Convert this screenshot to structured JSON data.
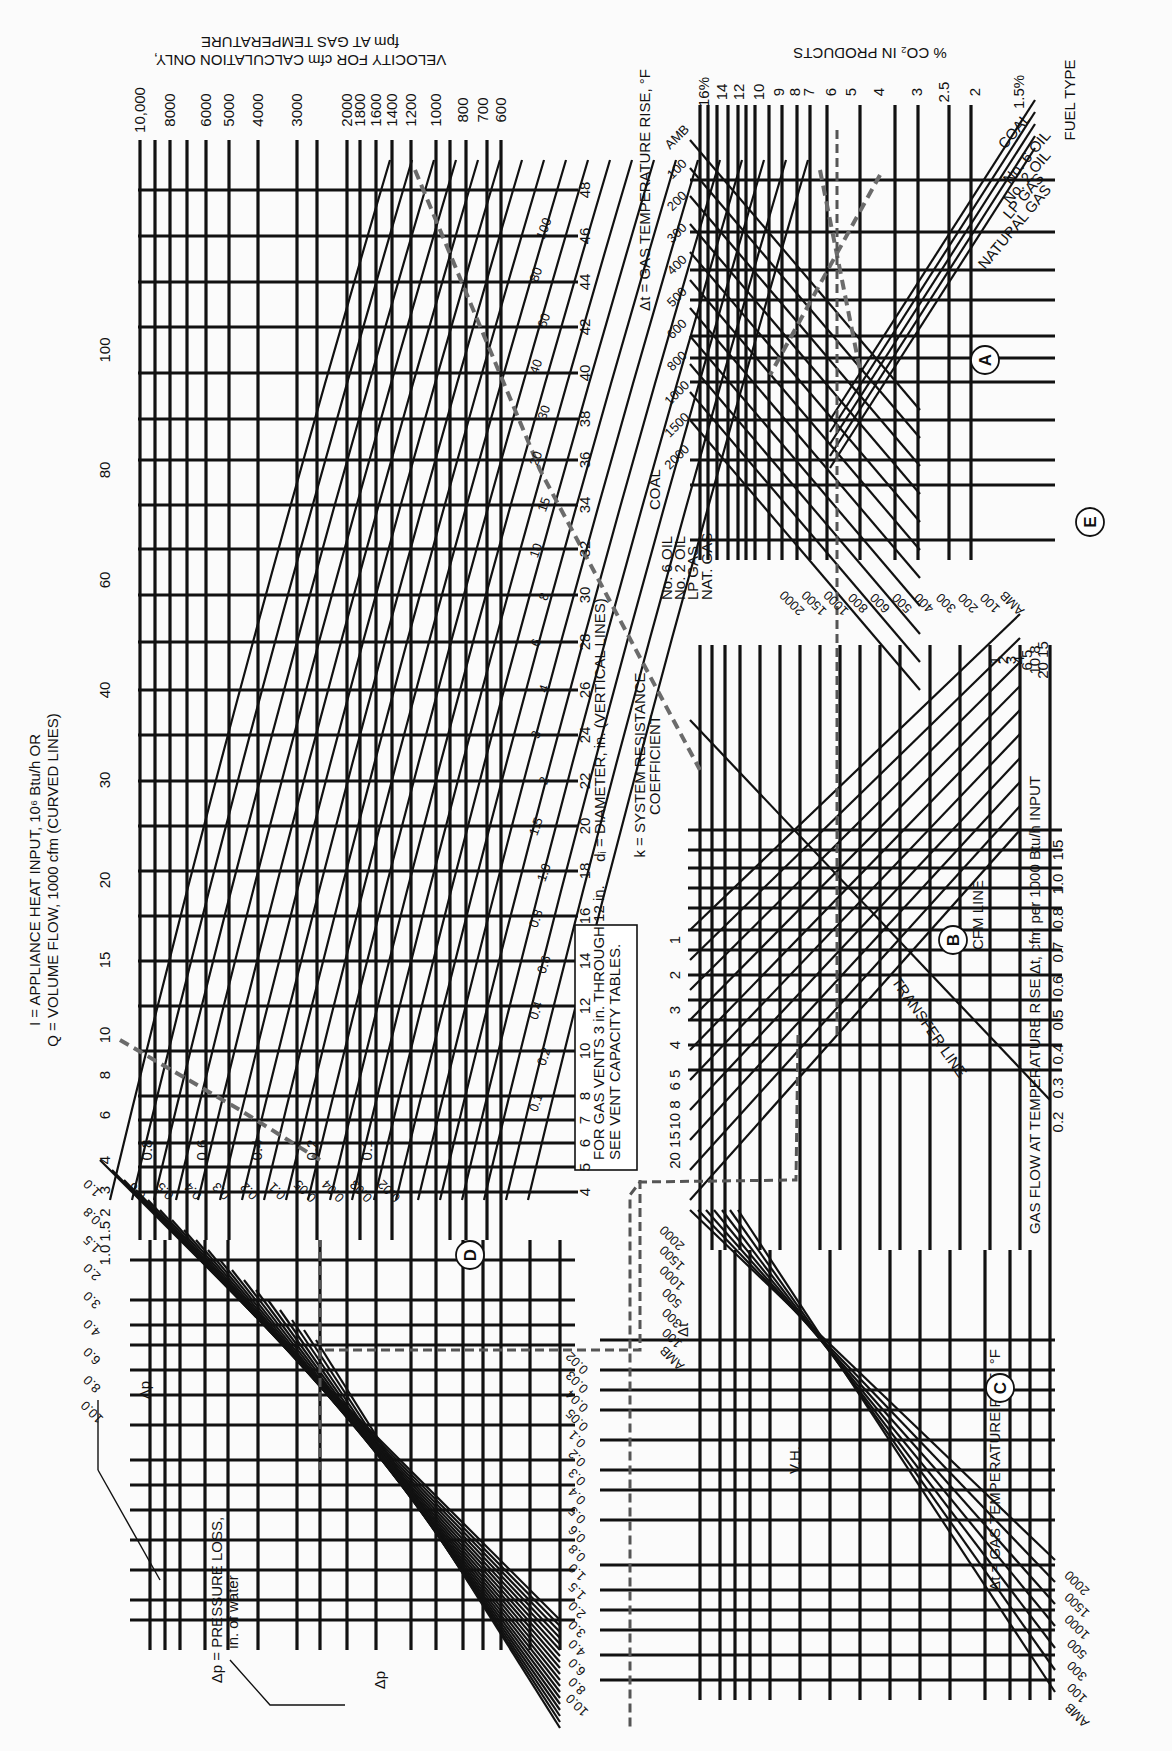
{
  "chart_data": {
    "type": "nomograph",
    "orientation": "rotated 90° clockwise",
    "sections": {
      "A": {
        "name": "Fuel type / CO2 / temperature rise",
        "axis_title_co2": "% CO2 IN PRODUCTS",
        "co2_ticks": [
          "16%",
          "14",
          "12",
          "10",
          "9",
          "8",
          "7",
          "6",
          "5",
          "4",
          "3",
          "2.5",
          "2",
          "1.5%"
        ],
        "axis_title_dt": "Δt = GAS TEMPERATURE RISE, °F",
        "dt_ticks_top": [
          "AMB",
          "100",
          "200",
          "300",
          "400",
          "500",
          "600",
          "800",
          "1000",
          "1500",
          "2000"
        ],
        "dt_ticks_bottom": [
          "2000",
          "1500",
          "1000",
          "800",
          "600",
          "500",
          "400",
          "300",
          "200",
          "100",
          "AMB"
        ],
        "fuel_label": "FUEL TYPE",
        "fuel_types_top": [
          "COAL",
          "No. 6 OIL",
          "No. 2 OIL",
          "LP GAS",
          "NATURAL GAS"
        ],
        "fuel_types_side": [
          "COAL",
          "No. 6 OIL",
          "No. 2 OIL",
          "LP GAS",
          "NAT. GAS"
        ]
      },
      "B": {
        "name": "Gas flow / system resistance",
        "axis_title": "GAS FLOW AT TEMPERATURE RISE Δt, cfm per 1000 Btu/h INPUT",
        "flow_ticks": [
          "0.2",
          "0.3",
          "0.4",
          "0.5",
          "0.6",
          "0.7",
          "0.8",
          "1.0",
          "1.5"
        ],
        "k_title": "k = SYSTEM RESISTANCE COEFFICIENT",
        "k_ticks": [
          "1",
          "2",
          "3",
          "4",
          "5",
          "6",
          "8",
          "10",
          "15",
          "20"
        ],
        "k_ticks_right": [
          "1",
          "2",
          "3",
          "4",
          "5",
          "6",
          "8",
          "10",
          "15",
          "20"
        ],
        "cfm_line": "CFM LINE",
        "transfer_line": "TRANSFER LINE"
      },
      "C": {
        "name": "Velocity head / temperature rise",
        "axis_title": "Δt = GAS TEMPERATURE RISE, °F",
        "dt_ticks": [
          "AMB",
          "100",
          "300",
          "500",
          "1000",
          "1500",
          "2000"
        ],
        "dt_ticks_inner": [
          "AMB",
          "100",
          "300",
          "500",
          "1000",
          "1500",
          "2000"
        ],
        "vh_label": "V.H.",
        "dt_label": "Δt"
      },
      "D": {
        "name": "Pressure loss",
        "axis_title": "Δp = PRESSURE LOSS, in. of water",
        "dp_ticks_left": [
          "0.02",
          "0.03",
          "0.04",
          "0.05",
          "0.1",
          "0.2",
          "0.3",
          "0.4",
          "0.5",
          "0.6",
          "0.8",
          "1.0",
          "1.5",
          "2.0",
          "3.0",
          "4.0",
          "6.0",
          "8.0",
          "10.0"
        ],
        "dp_ticks_bottom": [
          "0.02",
          "0.03",
          "0.04",
          "0.05",
          "0.1",
          "0.2",
          "0.3",
          "0.4",
          "0.5",
          "0.6",
          "0.8",
          "1.0",
          "1.5",
          "2.0",
          "3.0",
          "4.0",
          "6.0",
          "8.0",
          "10.0"
        ],
        "vel_head_ticks": [
          "1.0",
          "0.8",
          "0.6",
          "0.4",
          "0.2",
          "0.1"
        ],
        "dp_symbol": "Δp",
        "note": "FOR GAS VENTS 3 in. THROUGH 12 in. SEE VENT CAPACITY TABLES."
      },
      "E": {
        "name": "Diameter / heat input / velocity",
        "diameter_title": "di = DIAMETER, in. (VERTICAL LINES)",
        "diameter_ticks": [
          "4",
          "5",
          "6",
          "7",
          "8",
          "10",
          "12",
          "14",
          "16",
          "18",
          "20",
          "22",
          "24",
          "26",
          "28",
          "30",
          "32",
          "34",
          "36",
          "38",
          "40",
          "42",
          "44",
          "46",
          "48"
        ],
        "input_title_1": "I = APPLIANCE HEAT INPUT, 10⁶ Btu/h OR",
        "input_title_2": "Q = VOLUME FLOW, 1000 cfm (CURVED LINES)",
        "input_ticks": [
          "1.0",
          "1.5",
          "2",
          "3",
          "4",
          "6",
          "8",
          "10",
          "15",
          "20",
          "30",
          "40",
          "60",
          "80",
          "100"
        ],
        "curve_labels": [
          "0.1",
          "0.2",
          "0.4",
          "0.6",
          "0.8",
          "1.0",
          "1.5",
          "2",
          "3",
          "4",
          "6",
          "8",
          "10",
          "15",
          "20",
          "30",
          "40",
          "60",
          "80",
          "100"
        ],
        "velocity_title_1": "VELOCITY FOR cfm CALCULATION ONLY,",
        "velocity_title_2": "fpm AT GAS TEMPERATURE",
        "velocity_ticks": [
          "10,000",
          "8000",
          "6000",
          "5000",
          "4000",
          "3000",
          "2000",
          "1800",
          "1600",
          "1400",
          "1200",
          "1000",
          "800",
          "700",
          "600"
        ]
      }
    },
    "example_path": {
      "fuel": "NATURAL GAS",
      "co2_percent": 5,
      "dt_F": 1500,
      "k": 1,
      "heat_input_1e6_btuh": 10,
      "diameter_in": 24,
      "dp_in_water": 0.03
    }
  },
  "labels": {
    "vel_t1": "VELOCITY FOR cfm CALCULATION ONLY,",
    "vel_t2": "fpm AT GAS TEMPERATURE",
    "co2_t": "% CO₂ IN PRODUCTS",
    "inp_t1": "I = APPLIANCE HEAT INPUT, 10⁶ Btu/h OR",
    "inp_t2": "Q = VOLUME FLOW, 1000 cfm (CURVED LINES)",
    "dia_t": "dᵢ = DIAMETER, in. (VERTICAL LINES)",
    "k_t1": "k = SYSTEM RESISTANCE",
    "k_t2": "COEFFICIENT",
    "flow_t": "GAS FLOW AT TEMPERATURE RISE Δt, cfm per 1000 Btu/h INPUT",
    "dtA_t": "Δt = GAS TEMPERATURE RISE, °F",
    "dtC_t": "Δt = GAS TEMPERATURE RISE, °F",
    "dp_t1": "Δp = PRESSURE LOSS,",
    "dp_t2": "in. of water",
    "note1": "FOR GAS VENTS 3 in. THROUGH 12 in.",
    "note2": "SEE VENT CAPACITY TABLES.",
    "fuel_t": "FUEL TYPE",
    "cfm_line": "CFM LINE",
    "transfer": "TRANSFER LINE",
    "vh": "V.H.",
    "dt_sym": "Δt",
    "dp_sym": "Δp",
    "A": "A",
    "B": "B",
    "C": "C",
    "D": "D",
    "E": "E",
    "coal": "COAL",
    "no6": "No. 6 OIL",
    "no2": "No. 2 OIL",
    "lp": "LP GAS",
    "ng": "NATURAL GAS",
    "s_no6": "No. 6 OIL",
    "s_no2": "No. 2 OIL",
    "s_lp": "LP GAS",
    "s_ng": "NAT. GAS",
    "s_coal": "COAL"
  },
  "ticks": {
    "vel": [
      "10,000",
      "8000",
      "6000",
      "5000",
      "4000",
      "3000",
      "2000",
      "1800",
      "1600",
      "1400",
      "1200",
      "1000",
      "800",
      "700",
      "600"
    ],
    "co2": [
      "16%",
      "14",
      "12",
      "10",
      "9",
      "8",
      "7",
      "6",
      "5",
      "4",
      "3",
      "2.5",
      "2",
      "1.5%"
    ],
    "dia": [
      "48",
      "46",
      "44",
      "42",
      "40",
      "38",
      "36",
      "34",
      "32",
      "30",
      "28",
      "26",
      "24",
      "22",
      "20",
      "18",
      "16",
      "14",
      "12",
      "10",
      "8",
      "7",
      "6",
      "5",
      "4"
    ],
    "inp": [
      "100",
      "80",
      "60",
      "40",
      "30",
      "20",
      "15",
      "10",
      "8",
      "6",
      "4",
      "3",
      "1.5 2",
      "1.0"
    ],
    "curveE": [
      "100",
      "80",
      "60",
      "40",
      "30",
      "20",
      "15",
      "10",
      "8",
      "6",
      "4",
      "3",
      "2",
      "1.5",
      "1.0",
      "0.8",
      "0.6",
      "0.4",
      "0.2",
      "0.1"
    ],
    "vhD": [
      "0.8",
      "0.6",
      "0.4",
      "0.2",
      "0.1"
    ],
    "flow": [
      "1.5",
      "1.0",
      "0.8",
      "0.7",
      "0.6",
      "0.5",
      "0.4",
      "0.3",
      "0.2"
    ],
    "kR": [
      "1",
      "2",
      "3",
      "4",
      "6 5",
      "10 8",
      "20 15"
    ],
    "kL": [
      "1",
      "2",
      "3",
      "4",
      "6 5",
      "10 8",
      "20 15"
    ],
    "dtA_top": [
      "AMB",
      "100",
      "200",
      "300",
      "400",
      "500",
      "600",
      "800",
      "1000",
      "1500",
      "2000"
    ],
    "dtA_side": [
      "2000",
      "1500",
      "1000",
      "800",
      "600",
      "500",
      "400",
      "300",
      "200",
      "100",
      "AMB"
    ],
    "dtC": [
      "2000",
      "1500",
      "1000",
      "500",
      "300",
      "100",
      "AMB"
    ],
    "dtC_inner": [
      "2000",
      "1500",
      "1000",
      "500",
      "300",
      "100",
      "AMB"
    ],
    "dpL": [
      "0.6",
      "0.5",
      "0.4",
      "0.3",
      "0.2",
      "0.1",
      "0.05",
      "0.04",
      "0.03",
      "0.02"
    ],
    "dpL2": [
      "1.0",
      "0.8",
      "1.5",
      "2.0",
      "3.0",
      "4.0",
      "6.0",
      "8.0",
      "10.0"
    ],
    "dpB": [
      "0.02",
      "0.03",
      "0.04",
      "0.05",
      "0.1",
      "0.2",
      "0.3",
      "0.4",
      "0.5",
      "0.6",
      "0.8",
      "1.0",
      "1.5",
      "2.0",
      "3.0",
      "4.0",
      "6.0",
      "8.0",
      "10.0"
    ]
  },
  "colors": {
    "ink": "#111111",
    "dash": "#6b6b6b",
    "paper": "#fbfbfb"
  }
}
